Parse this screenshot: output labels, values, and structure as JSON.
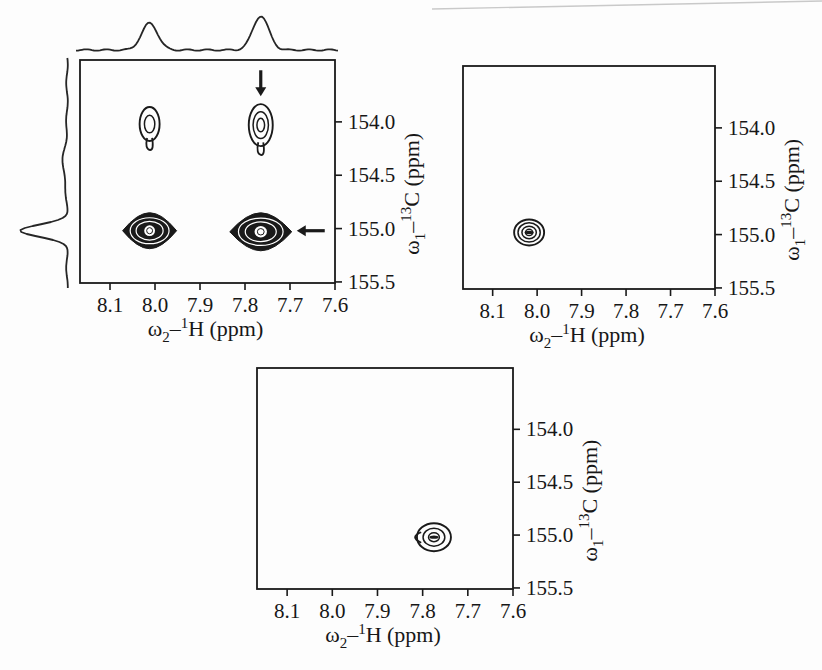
{
  "figure": {
    "ink_color": "#1a1a1a",
    "background": "#fdfdfd"
  },
  "chart_data": {
    "type": "contour",
    "axes": {
      "xlabel_text": "ω2–1H (ppm)",
      "ylabel_text": "ω1–13C (ppm)",
      "xlabel_parts": [
        [
          "ω",
          "n"
        ],
        [
          "2",
          "sub"
        ],
        [
          "–",
          "n"
        ],
        [
          "1",
          "sup"
        ],
        [
          "H (ppm)",
          "n"
        ]
      ],
      "ylabel_parts": [
        [
          "ω",
          "n"
        ],
        [
          "1",
          "sub"
        ],
        [
          "–",
          "n"
        ],
        [
          "13",
          "sup"
        ],
        [
          "C (ppm)",
          "n"
        ]
      ],
      "x_range": [
        8.1667,
        7.6
      ],
      "y_range": [
        153.42,
        155.51
      ],
      "x_ticks": [
        {
          "value": 8.1,
          "label": "8.1"
        },
        {
          "value": 8.0,
          "label": "8.0"
        },
        {
          "value": 7.9,
          "label": "7.9"
        },
        {
          "value": 7.8,
          "label": "7.8"
        },
        {
          "value": 7.7,
          "label": "7.7"
        },
        {
          "value": 7.6,
          "label": "7.6"
        }
      ],
      "y_ticks": [
        {
          "value": 154.0,
          "label": "154.0"
        },
        {
          "value": 154.5,
          "label": "154.5"
        },
        {
          "value": 155.0,
          "label": "155.0"
        },
        {
          "value": 155.5,
          "label": "155.5"
        }
      ],
      "grid": false
    },
    "panels": [
      {
        "id": "top-left",
        "box": {
          "left": 80,
          "top": 60,
          "width": 255,
          "height": 223
        },
        "peaks": [
          {
            "x": 8.012,
            "y": 154.02,
            "style": "open",
            "levels": 2,
            "rx": 10,
            "ry": 17,
            "tail": "down"
          },
          {
            "x": 7.765,
            "y": 154.03,
            "style": "open",
            "levels": 3,
            "rx": 12,
            "ry": 21,
            "tail": "down"
          },
          {
            "x": 8.012,
            "y": 155.02,
            "style": "filled",
            "rx": 27,
            "ry": 18
          },
          {
            "x": 7.765,
            "y": 155.03,
            "style": "filled",
            "rx": 31,
            "ry": 19
          }
        ],
        "arrows": [
          {
            "dir": "down",
            "x": 7.765,
            "tip_y": 153.76,
            "length_px": 26
          },
          {
            "dir": "left",
            "y": 155.02,
            "tip_x": 7.685,
            "length_px": 28
          }
        ],
        "projections": {
          "top": {
            "baseline_y": 50,
            "x_start": 76,
            "x_end": 338,
            "peaks": [
              {
                "x": 8.012,
                "amp": 27,
                "sigma": 8
              },
              {
                "x": 7.765,
                "amp": 34,
                "sigma": 8
              }
            ]
          },
          "left": {
            "baseline_x": 67,
            "y_start": 58,
            "y_end": 288,
            "peaks": [
              {
                "y": 155.02,
                "amp": 46,
                "sigma": 6
              },
              {
                "y": 154.4,
                "amp": 4,
                "sigma": 16
              }
            ]
          }
        }
      },
      {
        "id": "top-right",
        "box": {
          "left": 463,
          "top": 66,
          "width": 252,
          "height": 223
        },
        "peaks": [
          {
            "x": 8.018,
            "y": 154.98,
            "style": "open",
            "levels": 4,
            "rx": 15,
            "ry": 13,
            "center_dash": true
          }
        ],
        "arrows": [],
        "projections": null
      },
      {
        "id": "bottom-center",
        "box": {
          "left": 257,
          "top": 368,
          "width": 256,
          "height": 221
        },
        "peaks": [
          {
            "x": 7.775,
            "y": 155.02,
            "style": "open",
            "levels": 3,
            "rx": 17,
            "ry": 14,
            "center_dash": true,
            "tail": "left"
          }
        ],
        "arrows": [],
        "projections": null
      }
    ]
  }
}
